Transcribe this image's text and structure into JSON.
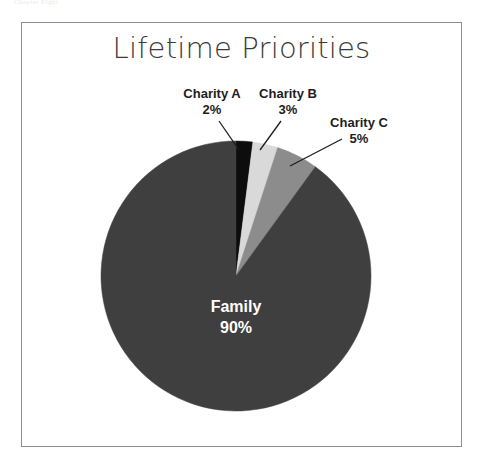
{
  "page": {
    "running_head": "Chapter Eight"
  },
  "figure": {
    "title": "Lifetime Priorities",
    "background_color": "#ffffff",
    "frame_color": "#8f8f8f"
  },
  "chart_data": {
    "type": "pie",
    "title": "Lifetime Priorities",
    "xlabel": "",
    "ylabel": "",
    "legend": "none",
    "start_angle_deg": 0,
    "direction": "clockwise",
    "categories": [
      "Charity A",
      "Charity B",
      "Charity C",
      "Family"
    ],
    "values": [
      2,
      3,
      5,
      90
    ],
    "value_unit": "%",
    "slices": [
      {
        "label": "Charity A",
        "value": 2,
        "value_label": "2%",
        "color": "#0d0d0d",
        "label_placement": "outside",
        "leader_line": true
      },
      {
        "label": "Charity B",
        "value": 3,
        "value_label": "3%",
        "color": "#d9d9d9",
        "label_placement": "outside",
        "leader_line": true
      },
      {
        "label": "Charity C",
        "value": 5,
        "value_label": "5%",
        "color": "#8c8c8c",
        "label_placement": "outside",
        "leader_line": true
      },
      {
        "label": "Family",
        "value": 90,
        "value_label": "90%",
        "color": "#3f3f3f",
        "label_placement": "inside",
        "leader_line": false,
        "inside_text_color": "#ffffff"
      }
    ]
  }
}
